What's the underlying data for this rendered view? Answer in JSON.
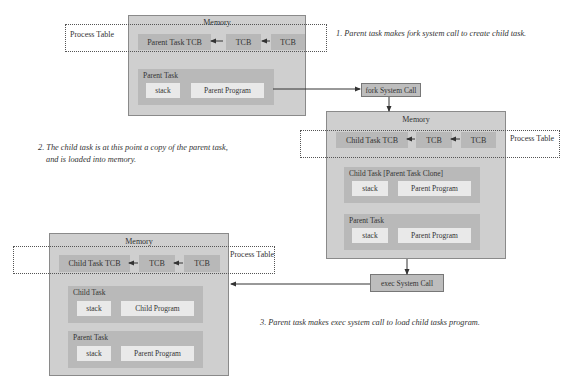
{
  "diagram": {
    "colors": {
      "memory_bg": "#cfcfcf",
      "task_bg": "#b9b9b9",
      "tcb_bg": "#b8b8b8",
      "segment_bg": "#e9e9e9",
      "syscall_bg": "#bdbdbd",
      "line": "#333333"
    },
    "notes": {
      "step1": "1. Parent task makes fork system call to create child task.",
      "step2_line1": "2. The child task is at this point a copy of the parent task,",
      "step2_line2": "and is loaded into memory.",
      "step3": "3. Parent task makes exec system call to load child tasks program."
    },
    "syscalls": {
      "fork": "fork System Call",
      "exec": "exec System Call"
    },
    "memory1": {
      "title": "Memory",
      "process_table_label": "Process Table",
      "tcbs": [
        "Parent Task TCB",
        "TCB",
        "TCB"
      ],
      "tasks": [
        {
          "label": "Parent Task",
          "stack": "stack",
          "program": "Parent Program"
        }
      ]
    },
    "memory2": {
      "title": "Memory",
      "process_table_label": "Process Table",
      "tcbs": [
        "Child Task TCB",
        "TCB",
        "TCB"
      ],
      "tasks": [
        {
          "label": "Child Task [Parent Task Clone]",
          "stack": "stack",
          "program": "Parent Program"
        },
        {
          "label": "Parent Task",
          "stack": "stack",
          "program": "Parent Program"
        }
      ]
    },
    "memory3": {
      "title": "Memory",
      "process_table_label": "Process Table",
      "tcbs": [
        "Child Task TCB",
        "TCB",
        "TCB"
      ],
      "tasks": [
        {
          "label": "Child Task",
          "stack": "stack",
          "program": "Child Program"
        },
        {
          "label": "Parent Task",
          "stack": "stack",
          "program": "Parent Program"
        }
      ]
    }
  }
}
